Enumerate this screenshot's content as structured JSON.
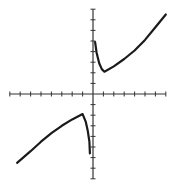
{
  "chart_data": {
    "type": "line",
    "title": "",
    "xlabel": "",
    "ylabel": "",
    "xlim": [
      -8,
      7
    ],
    "ylim": [
      -8,
      8
    ],
    "grid": false,
    "legend": null,
    "axis_ticks": {
      "x": [
        -8,
        -7,
        -6,
        -5,
        -4,
        -3,
        -2,
        -1,
        0,
        1,
        2,
        3,
        4,
        5,
        6,
        7
      ],
      "y": [
        -8,
        -7,
        -6,
        -5,
        -4,
        -3,
        -2,
        -1,
        0,
        1,
        2,
        3,
        4,
        5,
        6,
        7,
        8
      ]
    },
    "series": [
      {
        "name": "upper-branch",
        "points": [
          [
            0.2,
            4.9
          ],
          [
            0.35,
            3.9
          ],
          [
            0.6,
            2.9
          ],
          [
            0.85,
            2.35
          ],
          [
            1.1,
            2.1
          ],
          [
            2,
            2.6
          ],
          [
            3,
            3.3
          ],
          [
            4,
            4.1
          ],
          [
            5,
            5.1
          ],
          [
            6,
            6.3
          ],
          [
            7,
            7.5
          ]
        ]
      },
      {
        "name": "lower-branch",
        "points": [
          [
            -7.3,
            -6.5
          ],
          [
            -6,
            -5.4
          ],
          [
            -5,
            -4.5
          ],
          [
            -4,
            -3.7
          ],
          [
            -3,
            -3.0
          ],
          [
            -2,
            -2.4
          ],
          [
            -1,
            -1.9
          ],
          [
            -0.7,
            -2.6
          ],
          [
            -0.5,
            -3.5
          ],
          [
            -0.35,
            -4.5
          ],
          [
            -0.3,
            -5.6
          ]
        ]
      }
    ]
  },
  "style": {
    "axis_color": "#333333",
    "curve_color": "#1a1a1a",
    "background": "#ffffff"
  }
}
